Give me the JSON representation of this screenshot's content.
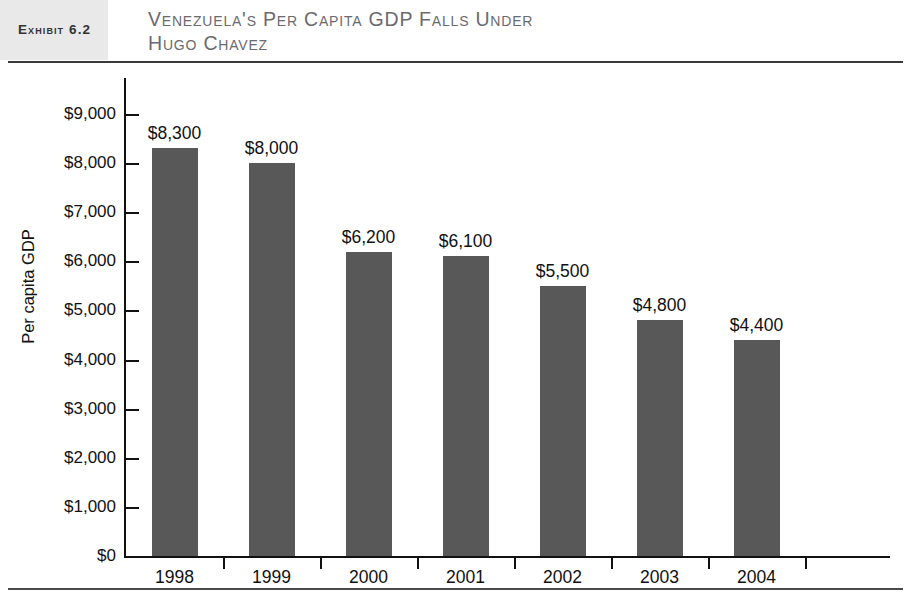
{
  "header": {
    "exhibit_label": "Exhibit 6.2",
    "title": "Venezuela's Per Capita GDP Falls Under\nHugo Chavez"
  },
  "chart_data": {
    "type": "bar",
    "title": "Venezuela's Per Capita GDP Falls Under Hugo Chavez",
    "xlabel": "",
    "ylabel": "Per capita GDP",
    "categories": [
      "1998",
      "1999",
      "2000",
      "2001",
      "2002",
      "2003",
      "2004"
    ],
    "values": [
      8300,
      8000,
      6200,
      6100,
      5500,
      4800,
      4400
    ],
    "value_labels": [
      "$8,300",
      "$8,000",
      "$6,200",
      "$6,100",
      "$5,500",
      "$4,800",
      "$4,400"
    ],
    "ylim": [
      0,
      9000
    ],
    "ytick_values": [
      0,
      1000,
      2000,
      3000,
      4000,
      5000,
      6000,
      7000,
      8000,
      9000
    ],
    "ytick_labels": [
      "$0",
      "$1,000",
      "$2,000",
      "$3,000",
      "$4,000",
      "$5,000",
      "$6,000",
      "$7,000",
      "$8,000",
      "$9,000"
    ],
    "grid": false,
    "legend": false,
    "bar_color": "#585858",
    "axis_color": "#111111",
    "background": "#ffffff"
  }
}
